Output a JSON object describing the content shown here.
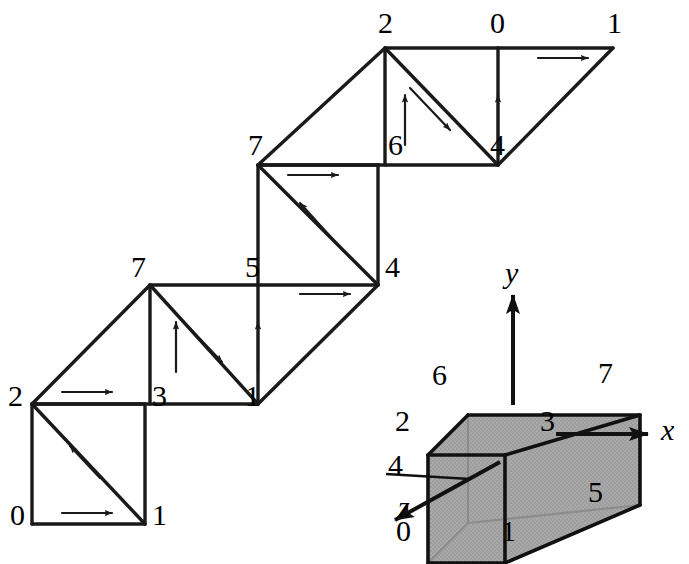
{
  "figure": {
    "kind": "triangle-strip-unwrapping-of-cube",
    "background_color": "#ffffff",
    "line_color": "#1a1a1a",
    "cube_face_fill": "#a8a8a8",
    "cube_hidden_edge_color": "#8f8f8f"
  },
  "strip": {
    "description": "Cube unfolded into a single triangle strip, drawn as a staircase of squares with diagonals and direction arrows.",
    "vertex_labels": [
      {
        "id": "s0",
        "text": "0",
        "x": 10,
        "y": 500
      },
      {
        "id": "s1",
        "text": "1",
        "x": 152,
        "y": 500
      },
      {
        "id": "s2",
        "text": "2",
        "x": 8,
        "y": 381
      },
      {
        "id": "s3",
        "text": "3",
        "x": 152,
        "y": 381
      },
      {
        "id": "s7a",
        "text": "7",
        "x": 131,
        "y": 252
      },
      {
        "id": "s5",
        "text": "5",
        "x": 245,
        "y": 252
      },
      {
        "id": "s1b",
        "text": "1",
        "x": 245,
        "y": 381
      },
      {
        "id": "s4a",
        "text": "4",
        "x": 385,
        "y": 252
      },
      {
        "id": "s7b",
        "text": "7",
        "x": 248,
        "y": 130
      },
      {
        "id": "s6",
        "text": "6",
        "x": 388,
        "y": 130
      },
      {
        "id": "s2b",
        "text": "2",
        "x": 378,
        "y": 8
      },
      {
        "id": "s0b",
        "text": "0",
        "x": 490,
        "y": 8
      },
      {
        "id": "s1c",
        "text": "1",
        "x": 607,
        "y": 8
      },
      {
        "id": "s4b",
        "text": "4",
        "x": 490,
        "y": 130
      }
    ]
  },
  "cube": {
    "description": "Reference cube showing the numbering of the eight corner vertices and the coordinate frame.",
    "vertex_labels": [
      {
        "id": "c0",
        "text": "0",
        "x": 396,
        "y": 516
      },
      {
        "id": "c1",
        "text": "1",
        "x": 501,
        "y": 516
      },
      {
        "id": "c2",
        "text": "2",
        "x": 395,
        "y": 406
      },
      {
        "id": "c3",
        "text": "3",
        "x": 540,
        "y": 406
      },
      {
        "id": "c4",
        "text": "4",
        "x": 388,
        "y": 450
      },
      {
        "id": "c5",
        "text": "5",
        "x": 588,
        "y": 477
      },
      {
        "id": "c6",
        "text": "6",
        "x": 432,
        "y": 360
      },
      {
        "id": "c7",
        "text": "7",
        "x": 598,
        "y": 358
      }
    ],
    "axes": [
      {
        "id": "axis-x",
        "text": "x",
        "x": 661,
        "y": 430
      },
      {
        "id": "axis-y",
        "text": "y",
        "x": 505,
        "y": 265
      },
      {
        "id": "axis-z",
        "text": "z",
        "x": 400,
        "y": 490
      }
    ]
  }
}
